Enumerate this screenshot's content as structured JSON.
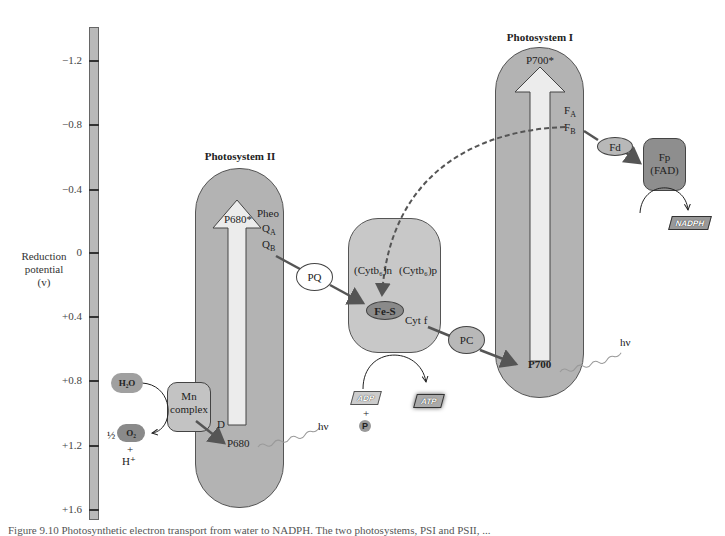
{
  "axis": {
    "label_line1": "Reduction",
    "label_line2": "potential",
    "label_line3": "(v)",
    "ticks": [
      "−1.2",
      "−0.8",
      "−0.4",
      "0",
      "+0.4",
      "+0.8",
      "+1.2",
      "+1.6"
    ]
  },
  "psii": {
    "title": "Photosystem II",
    "p680_star": "P680*",
    "pheo": "Pheo",
    "qa": "Q",
    "qa_sub": "A",
    "qb": "Q",
    "qb_sub": "B",
    "d": "D",
    "p680": "P680",
    "hv": "hν"
  },
  "mn_complex": {
    "line1": "Mn",
    "line2": "complex"
  },
  "water": {
    "h2o": "H₂O",
    "half": "½",
    "o2": "O₂",
    "plus": "+",
    "hplus": "H⁺"
  },
  "pq": {
    "label": "PQ"
  },
  "cyt_complex": {
    "cytb6n": "(Cytb₆)n",
    "cytb6p": "(Cytb₆)p",
    "fes": "Fe-S",
    "cytf": "Cyt f"
  },
  "atp": {
    "adp": "ADP",
    "plus": "+",
    "p": "P",
    "atp": "ATP"
  },
  "pc": {
    "label": "PC"
  },
  "psi": {
    "title": "Photosystem I",
    "p700_star": "P700*",
    "fa": "F",
    "fa_sub": "A",
    "fb": "F",
    "fb_sub": "B",
    "p700": "P700",
    "hv": "hν"
  },
  "fd": {
    "label": "Fd"
  },
  "fp": {
    "line1": "Fp",
    "line2": "(FAD)"
  },
  "nadph": {
    "label": "NADPH"
  },
  "caption": "Figure 9.10 Photosynthetic electron transport from water to NADPH. The two photosystems, PSI and PSII, ..."
}
